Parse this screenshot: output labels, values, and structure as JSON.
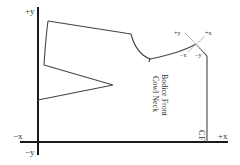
{
  "diagram": {
    "title": "Bodice Front",
    "subtitle": "Cowl Neck",
    "cf_label": "CF",
    "axes": {
      "plus_y": "+y",
      "minus_y": "−y",
      "minus_x": "−x",
      "plus_x": "+x"
    },
    "local_axes": {
      "plus_y": "+y",
      "plus_x": "+x",
      "minus_x": "−x",
      "minus_y": "−y"
    },
    "colors": {
      "axis": "#1a1a1a",
      "pattern_line": "#444444",
      "local_axis": "#bbbbbb",
      "background": "#ffffff"
    }
  }
}
